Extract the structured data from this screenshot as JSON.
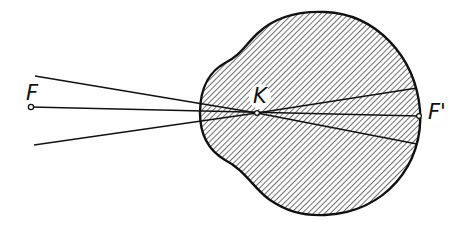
{
  "diagram": {
    "type": "reduced-eye-ray-diagram",
    "colors": {
      "stroke": "#111111",
      "hatch": "#222222",
      "background": "#ffffff"
    },
    "labels": {
      "object_focus": "F",
      "nodal_point": "K",
      "image_focus": "F'"
    },
    "points": {
      "F": [
        31,
        107
      ],
      "K": [
        257,
        113
      ],
      "F_prime": [
        419,
        116
      ]
    },
    "rays": [
      {
        "name": "upper-ray",
        "from": [
          35,
          76
        ],
        "to": [
          417,
          144
        ]
      },
      {
        "name": "axis-ray",
        "from": [
          31,
          107
        ],
        "to": [
          419,
          116
        ]
      },
      {
        "name": "lower-ray",
        "from": [
          34,
          145
        ],
        "to": [
          417,
          88
        ]
      }
    ],
    "eyeball": {
      "fill": "diagonal-hatch",
      "outline": "closed-curve"
    }
  }
}
